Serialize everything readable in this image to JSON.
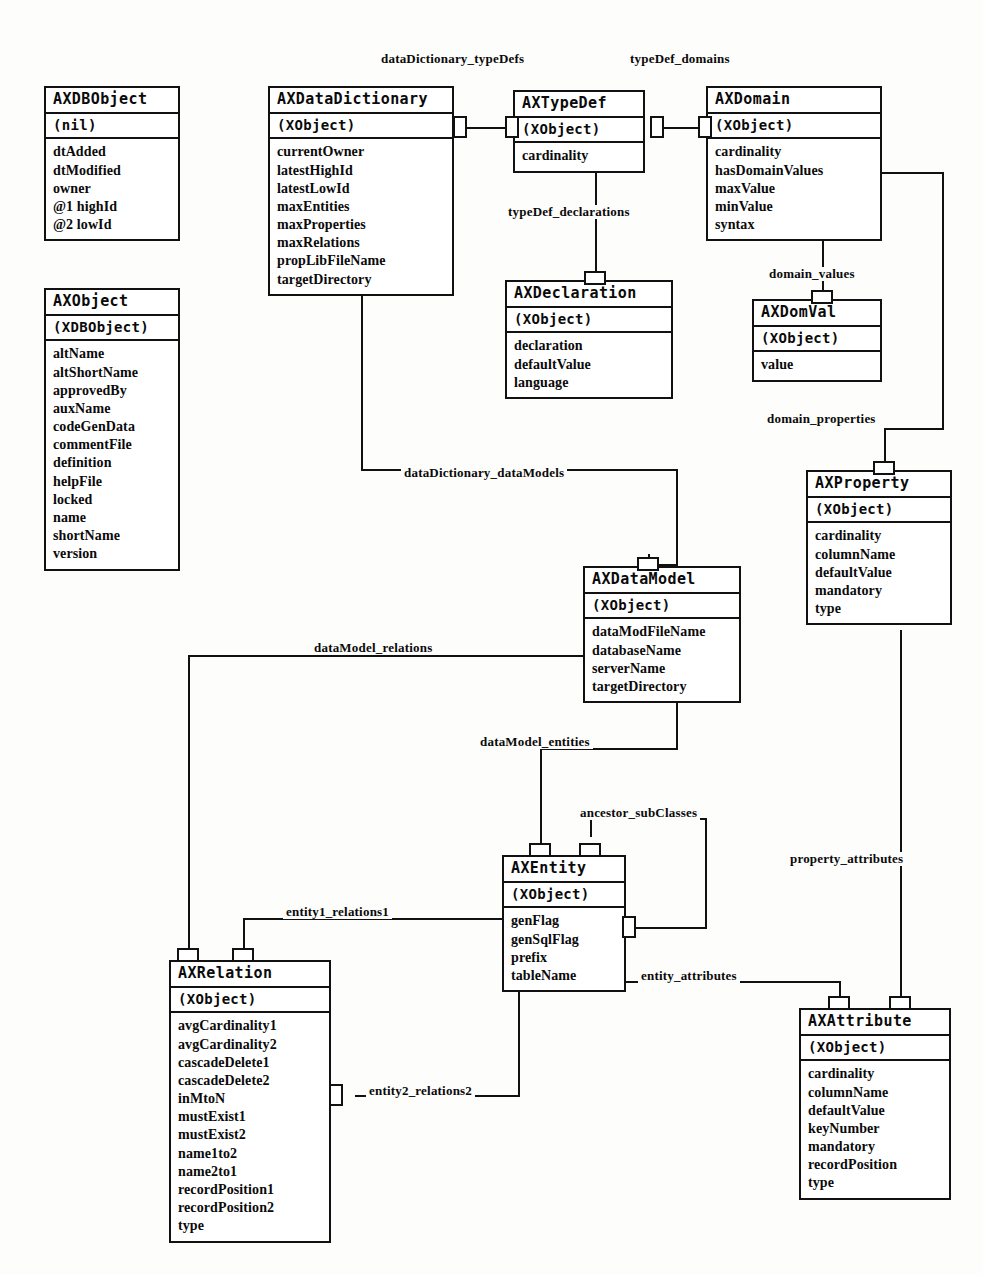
{
  "diagram": {
    "kind": "uml-class-diagram"
  },
  "classes": [
    {
      "id": "axdbobject",
      "name": "AXDBObject",
      "super": "(nil)",
      "attributes": [
        "dtAdded",
        "dtModified",
        "owner",
        "@1 highId",
        "@2 lowId"
      ]
    },
    {
      "id": "axdatadictionary",
      "name": "AXDataDictionary",
      "super": "(XObject)",
      "attributes": [
        "currentOwner",
        "latestHighId",
        "latestLowId",
        "maxEntities",
        "maxProperties",
        "maxRelations",
        "propLibFileName",
        "targetDirectory"
      ]
    },
    {
      "id": "axtypedef",
      "name": "AXTypeDef",
      "super": "(XObject)",
      "attributes": [
        "cardinality"
      ]
    },
    {
      "id": "axdomain",
      "name": "AXDomain",
      "super": "(XObject)",
      "attributes": [
        "cardinality",
        "hasDomainValues",
        "maxValue",
        "minValue",
        "syntax"
      ]
    },
    {
      "id": "axobject",
      "name": "AXObject",
      "super": "(XDBObject)",
      "attributes": [
        "altName",
        "altShortName",
        "approvedBy",
        "auxName",
        "codeGenData",
        "commentFile",
        "definition",
        "helpFile",
        "locked",
        "name",
        "shortName",
        "version"
      ]
    },
    {
      "id": "axdeclaration",
      "name": "AXDeclaration",
      "super": "(XObject)",
      "attributes": [
        "declaration",
        "defaultValue",
        "language"
      ]
    },
    {
      "id": "axdomval",
      "name": "AXDomVal",
      "super": "(XObject)",
      "attributes": [
        "value"
      ]
    },
    {
      "id": "axproperty",
      "name": "AXProperty",
      "super": "(XObject)",
      "attributes": [
        "cardinality",
        "columnName",
        "defaultValue",
        "mandatory",
        "type"
      ]
    },
    {
      "id": "axdatamodel",
      "name": "AXDataModel",
      "super": "(XObject)",
      "attributes": [
        "dataModFileName",
        "databaseName",
        "serverName",
        "targetDirectory"
      ]
    },
    {
      "id": "axentity",
      "name": "AXEntity",
      "super": "(XObject)",
      "attributes": [
        "genFlag",
        "genSqlFlag",
        "prefix",
        "tableName"
      ]
    },
    {
      "id": "axrelation",
      "name": "AXRelation",
      "super": "(XObject)",
      "attributes": [
        "avgCardinality1",
        "avgCardinality2",
        "cascadeDelete1",
        "cascadeDelete2",
        "inMtoN",
        "mustExist1",
        "mustExist2",
        "name1to2",
        "name2to1",
        "recordPosition1",
        "recordPosition2",
        "type"
      ]
    },
    {
      "id": "axattribute",
      "name": "AXAttribute",
      "super": "(XObject)",
      "attributes": [
        "cardinality",
        "columnName",
        "defaultValue",
        "keyNumber",
        "mandatory",
        "recordPosition",
        "type"
      ]
    }
  ],
  "relationships": [
    {
      "id": "r1",
      "label": "dataDictionary_typeDefs",
      "from": "axdatadictionary",
      "to": "axtypedef"
    },
    {
      "id": "r2",
      "label": "typeDef_domains",
      "from": "axtypedef",
      "to": "axdomain"
    },
    {
      "id": "r3",
      "label": "typeDef_declarations",
      "from": "axtypedef",
      "to": "axdeclaration"
    },
    {
      "id": "r4",
      "label": "domain_values",
      "from": "axdomain",
      "to": "axdomval"
    },
    {
      "id": "r5",
      "label": "domain_properties",
      "from": "axdomain",
      "to": "axproperty"
    },
    {
      "id": "r6",
      "label": "dataDictionary_dataModels",
      "from": "axdatadictionary",
      "to": "axdatamodel"
    },
    {
      "id": "r7",
      "label": "dataModel_relations",
      "from": "axdatamodel",
      "to": "axrelation"
    },
    {
      "id": "r8",
      "label": "dataModel_entities",
      "from": "axdatamodel",
      "to": "axentity"
    },
    {
      "id": "r9",
      "label": "ancestor_subClasses",
      "from": "axentity",
      "to": "axentity"
    },
    {
      "id": "r10",
      "label": "entity1_relations1",
      "from": "axentity",
      "to": "axrelation"
    },
    {
      "id": "r11",
      "label": "entity2_relations2",
      "from": "axentity",
      "to": "axrelation"
    },
    {
      "id": "r12",
      "label": "entity_attributes",
      "from": "axentity",
      "to": "axattribute"
    },
    {
      "id": "r13",
      "label": "property_attributes",
      "from": "axproperty",
      "to": "axattribute"
    }
  ],
  "colors": {
    "line": "#111111",
    "box_fill": "#ffffff",
    "background": "#fdfdfc"
  }
}
